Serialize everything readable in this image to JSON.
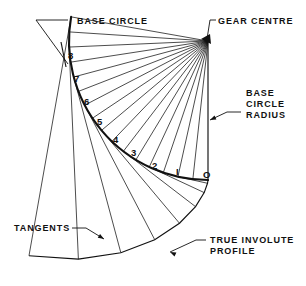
{
  "figure": {
    "width": 306,
    "height": 286,
    "background": "#ffffff",
    "ink": "#111111"
  },
  "geometry": {
    "gear_centre": {
      "x": 208,
      "y": 41
    },
    "base_circle_radius": 139,
    "angle_start_deg": 90,
    "angle_step_deg": 12.5,
    "point_count": 9,
    "radius_line": {
      "x1": 208,
      "y1": 41,
      "x2": 208,
      "y2": 181
    },
    "base_circle_extension": {
      "x1": 61,
      "y1": 42,
      "x2": 66,
      "y2": 67
    }
  },
  "labels": {
    "base_circle": {
      "text": "BASE CIRCLE",
      "x": 77,
      "y": 24,
      "leader": "M 36,20 L 68,20 M 36,20 L 68,64"
    },
    "gear_centre": {
      "text": "GEAR CENTRE",
      "x": 218,
      "y": 24,
      "leader": "M 210,20 L 216,20 M 210,20 L 207,39"
    },
    "base_circle_radius": {
      "lines": [
        "BASE",
        "CIRCLE",
        "RADIUS"
      ],
      "x": 246,
      "y": 96,
      "line_height": 11,
      "leader": "M 241,112 L 227,112 M 227,112 L 210,120"
    },
    "tangents": {
      "text": "TANGENTS",
      "x": 14,
      "y": 231,
      "leader": "M 72,228 L 86,228 M 86,228 L 104,239"
    },
    "true_involute_profile": {
      "lines": [
        "TRUE INVOLUTE",
        "PROFILE"
      ],
      "x": 210,
      "y": 243,
      "line_height": 11,
      "leader": "M 206,240 L 196,240 M 196,240 L 170,252"
    }
  },
  "point_labels": [
    {
      "id": "0",
      "text": "O",
      "x": 203,
      "y": 178
    },
    {
      "id": "1",
      "text": "I",
      "x": 176,
      "y": 175
    },
    {
      "id": "2",
      "text": "2",
      "x": 152,
      "y": 169
    },
    {
      "id": "3",
      "text": "3",
      "x": 131,
      "y": 156
    },
    {
      "id": "4",
      "text": "4",
      "x": 113,
      "y": 143
    },
    {
      "id": "5",
      "text": "5",
      "x": 97,
      "y": 125
    },
    {
      "id": "6",
      "text": "6",
      "x": 84,
      "y": 105
    },
    {
      "id": "7",
      "text": "7",
      "x": 74,
      "y": 82
    },
    {
      "id": "8",
      "text": "8",
      "x": 68,
      "y": 59
    }
  ],
  "legend_terms": {
    "base_circle": "BASE CIRCLE",
    "gear_centre": "GEAR CENTRE",
    "base_circle_radius": "BASE CIRCLE RADIUS",
    "tangents": "TANGENTS",
    "true_involute_profile": "TRUE INVOLUTE PROFILE"
  }
}
